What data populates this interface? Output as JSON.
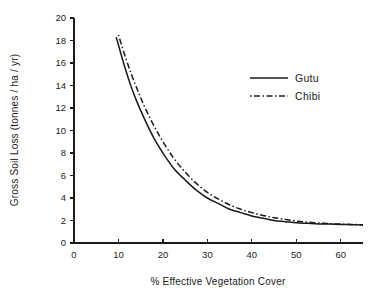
{
  "chart_data": {
    "type": "line",
    "title": "",
    "xlabel": "% Effective Vegetation Cover",
    "ylabel": "Gross Soil Loss (tonnes / ha / yr)",
    "xlim": [
      0,
      65
    ],
    "ylim": [
      0,
      20
    ],
    "grid": false,
    "legend_position": "upper right",
    "xticks": [
      0,
      10,
      20,
      30,
      40,
      50,
      60
    ],
    "xtick_labels": [
      "0",
      "10",
      "20",
      "30",
      "40",
      "50",
      "60"
    ],
    "yticks": [
      0,
      2,
      4,
      6,
      8,
      10,
      12,
      14,
      16,
      18,
      20
    ],
    "ytick_labels": [
      "0",
      "2",
      "4",
      "6",
      "8",
      "10",
      "12",
      "14",
      "16",
      "18",
      "20"
    ],
    "series": [
      {
        "name": "Gutu",
        "style": "solid",
        "color": "#1a1a1a",
        "x": [
          9.5,
          11,
          12.5,
          14,
          16,
          18,
          20,
          22.5,
          25,
          27.5,
          30,
          32.5,
          35,
          37.5,
          40,
          42.5,
          45,
          47.5,
          50,
          52.5,
          55,
          57.5,
          60,
          62.5,
          65
        ],
        "y": [
          18.3,
          16.2,
          14.3,
          12.7,
          10.9,
          9.3,
          8.0,
          6.6,
          5.6,
          4.7,
          4.0,
          3.5,
          3.0,
          2.7,
          2.4,
          2.2,
          2.0,
          1.9,
          1.8,
          1.75,
          1.7,
          1.68,
          1.65,
          1.63,
          1.6
        ]
      },
      {
        "name": "Chibi",
        "style": "dashed",
        "color": "#1a1a1a",
        "x": [
          10,
          11.5,
          13,
          14.5,
          16,
          18,
          20,
          22.5,
          25,
          27.5,
          30,
          32.5,
          35,
          37.5,
          40,
          42.5,
          45,
          47.5,
          50,
          52.5,
          55,
          57.5,
          60,
          62.5,
          65
        ],
        "y": [
          18.5,
          16.6,
          14.9,
          13.4,
          12.0,
          10.4,
          9.0,
          7.5,
          6.3,
          5.3,
          4.5,
          3.9,
          3.4,
          3.0,
          2.7,
          2.45,
          2.25,
          2.1,
          1.95,
          1.85,
          1.78,
          1.72,
          1.68,
          1.65,
          1.62
        ]
      }
    ]
  },
  "legend": {
    "entries": [
      {
        "label": "Gutu",
        "style": "solid"
      },
      {
        "label": "Chibi",
        "style": "dashed"
      }
    ]
  },
  "axes": {
    "x_title": "% Effective Vegetation Cover",
    "y_title": "Gross Soil Loss (tonnes / ha / yr)"
  }
}
